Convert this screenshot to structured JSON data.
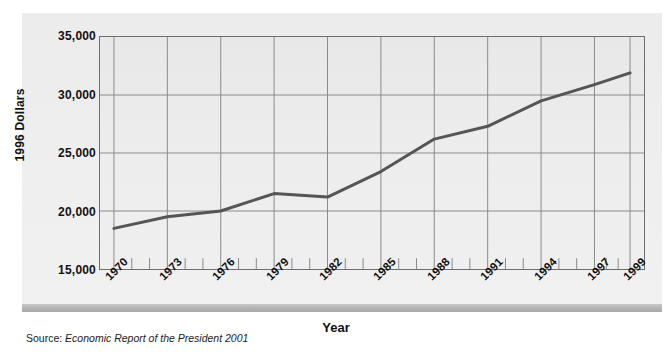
{
  "chart_data": {
    "type": "line",
    "title": "",
    "xlabel": "Year",
    "ylabel": "1996 Dollars",
    "x": [
      1970,
      1973,
      1976,
      1979,
      1982,
      1985,
      1988,
      1991,
      1994,
      1997,
      1999
    ],
    "values": [
      18500,
      19500,
      20000,
      21500,
      21200,
      23400,
      26200,
      27300,
      29500,
      30900,
      31900
    ],
    "categories": [
      "1970",
      "1973",
      "1976",
      "1979",
      "1982",
      "1985",
      "1988",
      "1991",
      "1994",
      "1997",
      "1999"
    ],
    "xlim": [
      1970,
      1999
    ],
    "ylim": [
      15000,
      35000
    ],
    "ytick_labels": [
      "35,000",
      "30,000",
      "25,000",
      "20,000",
      "15,000"
    ],
    "ytick_values": [
      35000,
      30000,
      25000,
      20000,
      15000
    ],
    "grid": "both",
    "legend": "none",
    "series": [
      {
        "name": "Median household income",
        "color": "#555555",
        "values": [
          18500,
          19500,
          20000,
          21500,
          21200,
          23400,
          26200,
          27300,
          29500,
          30900,
          31900
        ]
      }
    ],
    "minor_ticks_per_interval": 2
  },
  "axes": {
    "y_title": "1996 Dollars",
    "x_title": "Year"
  },
  "source": {
    "prefix": "Source:",
    "citation": "Economic Report of the President 2001"
  },
  "colors": {
    "line": "#555555",
    "grid": "#8a8a8a",
    "axis": "#4a4a4a",
    "plot_bg": "#ececec",
    "panel_bg": "#eeeeee",
    "text": "#111111"
  }
}
